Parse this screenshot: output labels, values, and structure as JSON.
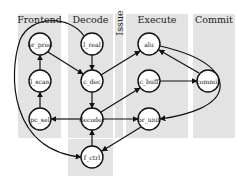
{
  "lanes": [
    {
      "id": "frontend",
      "label": "Frontend",
      "x": 18,
      "y": 14,
      "w": 43,
      "h": 124
    },
    {
      "id": "decode",
      "label": "Decode",
      "x": 68,
      "y": 14,
      "w": 45,
      "h": 124
    },
    {
      "id": "issue",
      "label": "Issue",
      "x": 115,
      "y": 14,
      "w": 8,
      "h": 124,
      "rotated": true
    },
    {
      "id": "execute",
      "label": "Execute",
      "x": 126,
      "y": 14,
      "w": 62,
      "h": 124
    },
    {
      "id": "commit",
      "label": "Commit",
      "x": 193,
      "y": 14,
      "w": 42,
      "h": 124
    }
  ],
  "extra_region": {
    "x": 68,
    "y": 139,
    "w": 45,
    "h": 37,
    "lane": "decode"
  },
  "nodes": [
    {
      "id": "br_pred",
      "label": "br_pred",
      "x": 40,
      "y": 44,
      "lane": "frontend"
    },
    {
      "id": "l_scan",
      "label": "l_scan",
      "x": 40,
      "y": 81,
      "lane": "frontend"
    },
    {
      "id": "pc_sel",
      "label": "pc_sel",
      "x": 40,
      "y": 119,
      "lane": "frontend"
    },
    {
      "id": "l_real",
      "label": "l_real",
      "x": 92,
      "y": 44,
      "lane": "decode"
    },
    {
      "id": "c_dec",
      "label": "c_dec",
      "x": 92,
      "y": 81,
      "lane": "decode"
    },
    {
      "id": "decoder",
      "label": "decoder",
      "x": 92,
      "y": 119,
      "lane": "decode"
    },
    {
      "id": "f_ctrl",
      "label": "f_ctrl",
      "x": 92,
      "y": 157,
      "lane": "decode"
    },
    {
      "id": "alu",
      "label": "alu",
      "x": 149,
      "y": 44,
      "lane": "execute"
    },
    {
      "id": "c_buff",
      "label": "c_buff",
      "x": 149,
      "y": 81,
      "lane": "execute"
    },
    {
      "id": "br_unit",
      "label": "br_unit",
      "x": 149,
      "y": 119,
      "lane": "execute"
    },
    {
      "id": "commit",
      "label": "commit",
      "x": 208,
      "y": 81,
      "lane": "commit"
    }
  ],
  "edges": [
    {
      "from": "l_scan",
      "to": "br_pred",
      "d": "M40,71 L40,55"
    },
    {
      "from": "pc_sel",
      "to": "l_scan",
      "d": "M40,108 L40,92"
    },
    {
      "from": "br_pred",
      "to": "c_dec",
      "d": "M48,52 L83,74"
    },
    {
      "from": "l_real",
      "to": "c_dec",
      "d": "M92,55 L92,70"
    },
    {
      "from": "c_dec",
      "to": "decoder",
      "d": "M92,92 L92,108"
    },
    {
      "from": "decoder",
      "to": "pc_sel",
      "d": "M81,119 L51,119"
    },
    {
      "from": "decoder",
      "to": "br_unit",
      "d": "M103,119 L138,119"
    },
    {
      "from": "f_ctrl",
      "to": "decoder",
      "d": "M92,146 L92,130"
    },
    {
      "from": "c_dec",
      "to": "alu",
      "d": "M101,75 L140,51"
    },
    {
      "from": "decoder",
      "to": "c_buff",
      "d": "M101,112 L140,88"
    },
    {
      "from": "c_buff",
      "to": "commit",
      "d": "M160,81 L197,81"
    },
    {
      "from": "commit",
      "to": "alu",
      "d": "M199,73 L159,50"
    },
    {
      "from": "alu",
      "to": "br_unit",
      "d": "M160,46 C200,55 222,70 220,88 C218,105 190,115 160,119"
    },
    {
      "from": "br_unit",
      "to": "f_ctrl",
      "d": "M141,127 L102,151"
    },
    {
      "from": "l_real",
      "to": "f_ctrl",
      "d": "M84,36 C70,15 30,15 20,40 C8,75 10,150 81,157"
    }
  ]
}
